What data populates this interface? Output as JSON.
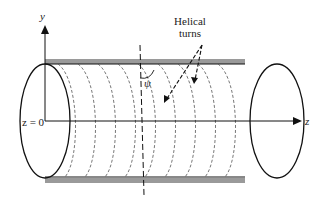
{
  "diagram": {
    "labels": {
      "y_axis": "y",
      "z_axis": "z",
      "origin": "z = 0",
      "angle": "ψ",
      "annotation_line1": "Helical",
      "annotation_line2": "turns"
    },
    "colors": {
      "stroke": "#111111",
      "band": "#999999",
      "dashed": "#555555"
    }
  }
}
